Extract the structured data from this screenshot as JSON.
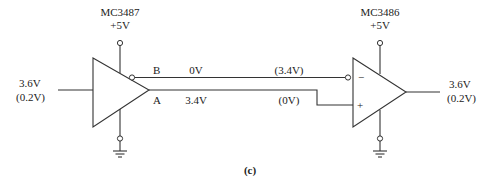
{
  "driver": {
    "part": "MC3487",
    "supply": "+5V",
    "input_high": "3.6V",
    "input_low": "(0.2V)",
    "output_b_label": "B",
    "output_a_label": "A"
  },
  "line": {
    "b_driver_voltage": "0V",
    "a_driver_voltage": "3.4V",
    "b_alt_voltage": "(3.4V)",
    "a_alt_voltage": "(0V)"
  },
  "receiver": {
    "part": "MC3486",
    "supply": "+5V",
    "inverting_label": "−",
    "noninverting_label": "+",
    "output_high": "3.6V",
    "output_low": "(0.2V)"
  },
  "caption": "(c)",
  "colors": {
    "line": "#333333",
    "text": "#222222",
    "background": "#ffffff"
  }
}
